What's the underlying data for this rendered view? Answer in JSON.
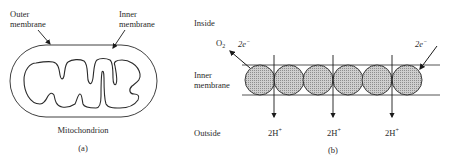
{
  "panel_a": {
    "label": "(a)",
    "caption": "Mitochondrion",
    "outer_membrane_label": [
      "Outer",
      "membrane"
    ],
    "inner_membrane_label": [
      "Inner",
      "membrane"
    ]
  },
  "panel_b": {
    "label": "(b)",
    "inside_label": "Inside",
    "outside_label": "Outside",
    "membrane_label": [
      "Inner",
      "membrane"
    ],
    "oxygen_label": "O",
    "oxygen_subscript": "2",
    "electrons_left": "2e",
    "electrons_right": "2e",
    "electron_superscript": "−",
    "proton_labels": [
      {
        "text": "2H",
        "sup": "+"
      },
      {
        "text": "2H",
        "sup": "+"
      },
      {
        "text": "2H",
        "sup": "+"
      }
    ],
    "protein_count": 6,
    "colors": {
      "stroke": "#2a2a2a",
      "protein_fill": "#bdbdbd",
      "background": "#ffffff"
    }
  }
}
